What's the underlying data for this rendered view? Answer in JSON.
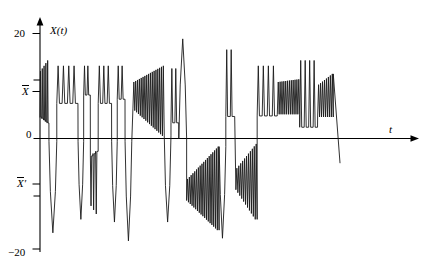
{
  "figure": {
    "background": "#ffffff",
    "line_color": "#1a1a1a",
    "axis_color": "#000000"
  },
  "labels": {
    "y_axis_title": "X(t)",
    "x_axis_title": "t",
    "tick_top": "20",
    "tick_bottom": "−20",
    "tick_zero": "0",
    "tick_mean_upper_base": "X",
    "tick_mean_upper_prime": "",
    "tick_mean_lower_base": "X",
    "tick_mean_lower_prime": "′"
  },
  "chart_data": {
    "type": "line",
    "title": "",
    "xlabel": "t",
    "ylabel": "X(t)",
    "ylim": [
      -20,
      20
    ],
    "xlim": [
      0,
      100
    ],
    "grid": false,
    "legend": null,
    "yticks": [
      {
        "value": 20,
        "label": "20"
      },
      {
        "value": 10.5,
        "label": "X̄"
      },
      {
        "value": 0,
        "label": "0"
      },
      {
        "value": -9.5,
        "label": "X̄′"
      },
      {
        "value": -20,
        "label": "−20"
      }
    ],
    "xticks": [],
    "annotations": [],
    "series": [
      {
        "name": "X(t)",
        "color": "#1a1a1a",
        "width": 0.9,
        "segments": [
          {
            "kind": "spikes",
            "x0": 2.0,
            "x1": 6.0,
            "n": 5,
            "base": 7.5,
            "amp0": 5.5,
            "amp1": 7.5,
            "dir": "up",
            "duty": 0.55
          },
          {
            "kind": "spike",
            "x0": 6.0,
            "x1": 9.5,
            "base": 0.0,
            "peak": -17.0,
            "dir": "down"
          },
          {
            "kind": "spikes",
            "x0": 9.5,
            "x1": 19.0,
            "n": 4,
            "base": 9.5,
            "amp0": 4.5,
            "amp1": 4.5,
            "dir": "up",
            "duty": 0.5
          },
          {
            "kind": "spike",
            "x0": 19.0,
            "x1": 21.5,
            "base": 0.0,
            "peak": -14.5,
            "dir": "down"
          },
          {
            "kind": "spikes",
            "x0": 21.5,
            "x1": 24.5,
            "n": 2,
            "base": 10.5,
            "amp0": 3.5,
            "amp1": 3.5,
            "dir": "up",
            "duty": 0.5
          },
          {
            "kind": "spikes",
            "x0": 24.5,
            "x1": 28.0,
            "n": 3,
            "base": -6.0,
            "amp0": 6.0,
            "amp1": 7.5,
            "dir": "down",
            "duty": 0.5
          },
          {
            "kind": "spikes",
            "x0": 28.0,
            "x1": 34.0,
            "n": 3,
            "base": 9.5,
            "amp0": 4.5,
            "amp1": 4.5,
            "dir": "up",
            "duty": 0.5
          },
          {
            "kind": "spike",
            "x0": 34.0,
            "x1": 36.5,
            "base": 0.0,
            "peak": -15.0,
            "dir": "down"
          },
          {
            "kind": "spikes",
            "x0": 36.5,
            "x1": 40.0,
            "n": 2,
            "base": 10.0,
            "amp0": 4.0,
            "amp1": 4.0,
            "dir": "up",
            "duty": 0.5
          },
          {
            "kind": "spike",
            "x0": 40.0,
            "x1": 43.0,
            "base": 0.0,
            "peak": -18.5,
            "dir": "down"
          },
          {
            "kind": "chirp",
            "x0": 43.5,
            "x1": 57.5,
            "n": 17,
            "lo0": 6.0,
            "lo1": 1.0,
            "hi0": 11.0,
            "hi1": 14.0
          },
          {
            "kind": "spike",
            "x0": 57.5,
            "x1": 60.5,
            "base": 1.0,
            "peak": -15.0,
            "dir": "down"
          },
          {
            "kind": "spikes",
            "x0": 60.5,
            "x1": 64.0,
            "n": 2,
            "base": 7.0,
            "amp0": 6.5,
            "amp1": 6.5,
            "dir": "up",
            "duty": 0.45
          },
          {
            "kind": "spike",
            "x0": 64.0,
            "x1": 67.5,
            "base": 0.5,
            "peak": 19.0,
            "dir": "up"
          },
          {
            "kind": "chirp",
            "x0": 67.5,
            "x1": 82.0,
            "n": 18,
            "lo0": -11.0,
            "lo1": -16.5,
            "hi0": -7.0,
            "hi1": -1.0
          },
          {
            "kind": "spike",
            "x0": 82.0,
            "x1": 85.0,
            "base": -1.0,
            "peak": -18.0,
            "dir": "down"
          },
          {
            "kind": "spikes",
            "x0": 85.0,
            "x1": 89.0,
            "n": 2,
            "base": 9.0,
            "amp0": 8.0,
            "amp1": 8.0,
            "dir": "up",
            "duty": 0.4
          },
          {
            "kind": "chirp",
            "x0": 89.5,
            "x1": 99.0,
            "n": 11,
            "lo0": -9.0,
            "lo1": -14.5,
            "hi0": -5.0,
            "hi1": -0.5
          },
          {
            "kind": "spikes",
            "x0": 99.0,
            "x1": 108.0,
            "n": 4,
            "base": 8.0,
            "amp0": 6.0,
            "amp1": 6.0,
            "dir": "up",
            "duty": 0.45
          },
          {
            "kind": "chirp",
            "x0": 108.0,
            "x1": 118.0,
            "n": 12,
            "lo0": 5.0,
            "lo1": 5.0,
            "hi0": 11.0,
            "hi1": 11.5
          },
          {
            "kind": "spikes",
            "x0": 118.0,
            "x1": 126.0,
            "n": 4,
            "base": 7.0,
            "amp0": 8.0,
            "amp1": 8.0,
            "dir": "up",
            "duty": 0.45
          },
          {
            "kind": "chirp",
            "x0": 126.0,
            "x1": 133.0,
            "n": 8,
            "lo0": 4.5,
            "lo1": 4.5,
            "hi0": 10.5,
            "hi1": 12.5
          },
          {
            "kind": "tail",
            "x0": 133.0,
            "x1": 136.0,
            "y0": 12.5,
            "y1": -4.0
          }
        ]
      }
    ]
  }
}
